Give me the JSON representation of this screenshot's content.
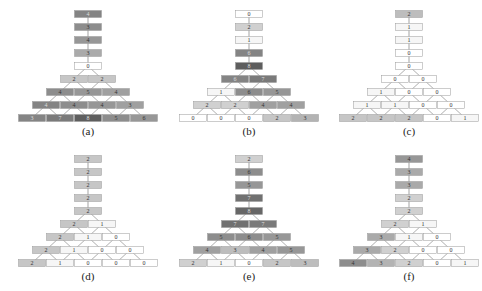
{
  "figure": {
    "panels": [
      {
        "id": "a",
        "caption": "(a)",
        "stem": [
          {
            "v": "4",
            "shade": 0.65
          },
          {
            "v": "3",
            "shade": 0.6
          },
          {
            "v": "4",
            "shade": 0.55
          },
          {
            "v": "3",
            "shade": 0.45
          },
          {
            "v": "0",
            "shade": 0.0
          }
        ],
        "rows": [
          [
            {
              "v": "2",
              "shade": 0.3
            },
            {
              "v": "2",
              "shade": 0.3
            }
          ],
          [
            {
              "v": "4",
              "shade": 0.6
            },
            {
              "v": "5",
              "shade": 0.55
            },
            {
              "v": "4",
              "shade": 0.5
            }
          ],
          [
            {
              "v": "4",
              "shade": 0.65
            },
            {
              "v": "4",
              "shade": 0.6
            },
            {
              "v": "4",
              "shade": 0.55
            },
            {
              "v": "3",
              "shade": 0.5
            }
          ],
          [
            {
              "v": "3",
              "shade": 0.65
            },
            {
              "v": "7",
              "shade": 0.7
            },
            {
              "v": "8",
              "shade": 0.85
            },
            {
              "v": "5",
              "shade": 0.6
            },
            {
              "v": "6",
              "shade": 0.55
            }
          ]
        ]
      },
      {
        "id": "b",
        "caption": "(b)",
        "stem": [
          {
            "v": "0",
            "shade": 0.0
          },
          {
            "v": "2",
            "shade": 0.25
          },
          {
            "v": "1",
            "shade": 0.05
          },
          {
            "v": "6",
            "shade": 0.65
          },
          {
            "v": "8",
            "shade": 0.85
          }
        ],
        "rows": [
          [
            {
              "v": "6",
              "shade": 0.65
            },
            {
              "v": "7",
              "shade": 0.7
            }
          ],
          [
            {
              "v": "1",
              "shade": 0.05
            },
            {
              "v": "6",
              "shade": 0.6
            },
            {
              "v": "5",
              "shade": 0.55
            }
          ],
          [
            {
              "v": "2",
              "shade": 0.25
            },
            {
              "v": "2",
              "shade": 0.25
            },
            {
              "v": "4",
              "shade": 0.5
            },
            {
              "v": "4",
              "shade": 0.5
            }
          ],
          [
            {
              "v": "0",
              "shade": 0.0
            },
            {
              "v": "0",
              "shade": 0.0
            },
            {
              "v": "0",
              "shade": 0.0
            },
            {
              "v": "2",
              "shade": 0.3
            },
            {
              "v": "3",
              "shade": 0.4
            }
          ]
        ]
      },
      {
        "id": "c",
        "caption": "(c)",
        "stem": [
          {
            "v": "2",
            "shade": 0.35
          },
          {
            "v": "1",
            "shade": 0.05
          },
          {
            "v": "1",
            "shade": 0.05
          },
          {
            "v": "0",
            "shade": 0.0
          },
          {
            "v": "0",
            "shade": 0.0
          }
        ],
        "rows": [
          [
            {
              "v": "0",
              "shade": 0.0
            },
            {
              "v": "0",
              "shade": 0.0
            }
          ],
          [
            {
              "v": "1",
              "shade": 0.05
            },
            {
              "v": "0",
              "shade": 0.0
            },
            {
              "v": "0",
              "shade": 0.0
            }
          ],
          [
            {
              "v": "1",
              "shade": 0.05
            },
            {
              "v": "1",
              "shade": 0.05
            },
            {
              "v": "0",
              "shade": 0.0
            },
            {
              "v": "0",
              "shade": 0.0
            }
          ],
          [
            {
              "v": "2",
              "shade": 0.3
            },
            {
              "v": "2",
              "shade": 0.3
            },
            {
              "v": "2",
              "shade": 0.3
            },
            {
              "v": "0",
              "shade": 0.0
            },
            {
              "v": "1",
              "shade": 0.05
            }
          ]
        ]
      },
      {
        "id": "d",
        "caption": "(d)",
        "stem": [
          {
            "v": "2",
            "shade": 0.3
          },
          {
            "v": "2",
            "shade": 0.3
          },
          {
            "v": "2",
            "shade": 0.3
          },
          {
            "v": "2",
            "shade": 0.3
          },
          {
            "v": "2",
            "shade": 0.3
          }
        ],
        "rows": [
          [
            {
              "v": "2",
              "shade": 0.3
            },
            {
              "v": "1",
              "shade": 0.05
            }
          ],
          [
            {
              "v": "2",
              "shade": 0.3
            },
            {
              "v": "1",
              "shade": 0.05
            },
            {
              "v": "0",
              "shade": 0.0
            }
          ],
          [
            {
              "v": "2",
              "shade": 0.3
            },
            {
              "v": "1",
              "shade": 0.05
            },
            {
              "v": "0",
              "shade": 0.0
            },
            {
              "v": "0",
              "shade": 0.0
            }
          ],
          [
            {
              "v": "2",
              "shade": 0.3
            },
            {
              "v": "1",
              "shade": 0.05
            },
            {
              "v": "0",
              "shade": 0.0
            },
            {
              "v": "0",
              "shade": 0.0
            },
            {
              "v": "0",
              "shade": 0.0
            }
          ]
        ]
      },
      {
        "id": "e",
        "caption": "(e)",
        "stem": [
          {
            "v": "2",
            "shade": 0.25
          },
          {
            "v": "6",
            "shade": 0.6
          },
          {
            "v": "5",
            "shade": 0.55
          },
          {
            "v": "7",
            "shade": 0.75
          },
          {
            "v": "8",
            "shade": 0.8
          }
        ],
        "rows": [
          [
            {
              "v": "7",
              "shade": 0.75
            },
            {
              "v": "7",
              "shade": 0.7
            }
          ],
          [
            {
              "v": "5",
              "shade": 0.6
            },
            {
              "v": "6",
              "shade": 0.6
            },
            {
              "v": "5",
              "shade": 0.55
            }
          ],
          [
            {
              "v": "4",
              "shade": 0.5
            },
            {
              "v": "3",
              "shade": 0.35
            },
            {
              "v": "4",
              "shade": 0.5
            },
            {
              "v": "5",
              "shade": 0.55
            }
          ],
          [
            {
              "v": "2",
              "shade": 0.25
            },
            {
              "v": "1",
              "shade": 0.05
            },
            {
              "v": "0",
              "shade": 0.0
            },
            {
              "v": "2",
              "shade": 0.3
            },
            {
              "v": "3",
              "shade": 0.35
            }
          ]
        ]
      },
      {
        "id": "f",
        "caption": "(f)",
        "stem": [
          {
            "v": "4",
            "shade": 0.55
          },
          {
            "v": "3",
            "shade": 0.45
          },
          {
            "v": "3",
            "shade": 0.45
          },
          {
            "v": "2",
            "shade": 0.25
          },
          {
            "v": "2",
            "shade": 0.25
          }
        ],
        "rows": [
          [
            {
              "v": "2",
              "shade": 0.25
            },
            {
              "v": "1",
              "shade": 0.05
            }
          ],
          [
            {
              "v": "3",
              "shade": 0.45
            },
            {
              "v": "1",
              "shade": 0.05
            },
            {
              "v": "0",
              "shade": 0.0
            }
          ],
          [
            {
              "v": "3",
              "shade": 0.45
            },
            {
              "v": "2",
              "shade": 0.25
            },
            {
              "v": "0",
              "shade": 0.0
            },
            {
              "v": "0",
              "shade": 0.0
            }
          ],
          [
            {
              "v": "4",
              "shade": 0.6
            },
            {
              "v": "3",
              "shade": 0.4
            },
            {
              "v": "2",
              "shade": 0.25
            },
            {
              "v": "0",
              "shade": 0.0
            },
            {
              "v": "1",
              "shade": 0.05
            }
          ]
        ]
      }
    ]
  }
}
